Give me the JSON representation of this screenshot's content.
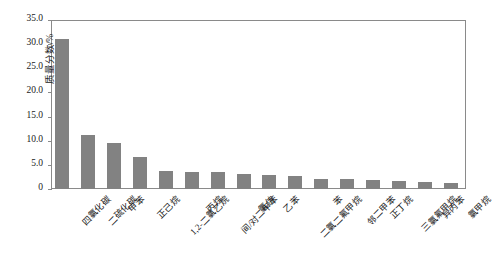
{
  "chart_data": {
    "type": "bar",
    "title": "",
    "xlabel": "",
    "ylabel": "质量分数/%",
    "ylim": [
      0,
      35
    ],
    "ytick_step": 5,
    "ytick_labels": [
      "35.0",
      "30.0",
      "25.0",
      "20.0",
      "15.0",
      "10.0",
      "5.0",
      "0"
    ],
    "ytick_values": [
      35.0,
      30.0,
      25.0,
      20.0,
      15.0,
      10.0,
      5.0,
      0
    ],
    "grid": false,
    "legend": false,
    "bar_color": "#828282",
    "axis_color": "#8a8a8a",
    "categories": [
      "四氯化碳",
      "二硫化碳",
      "甲苯",
      "正己烷",
      "1,2-二氯乙烷",
      "丙烷",
      "间/对二甲苯",
      "氯仿",
      "乙苯",
      "二氯二氟甲烷",
      "苯",
      "邻二甲苯",
      "正丁烷",
      "三氯氟甲烷",
      "异丙苯",
      "氯甲烷"
    ],
    "values": [
      31.1,
      11.2,
      9.5,
      6.6,
      3.7,
      3.6,
      3.5,
      3.2,
      3.0,
      2.6,
      2.1,
      2.0,
      1.9,
      1.7,
      1.4,
      1.3
    ]
  }
}
